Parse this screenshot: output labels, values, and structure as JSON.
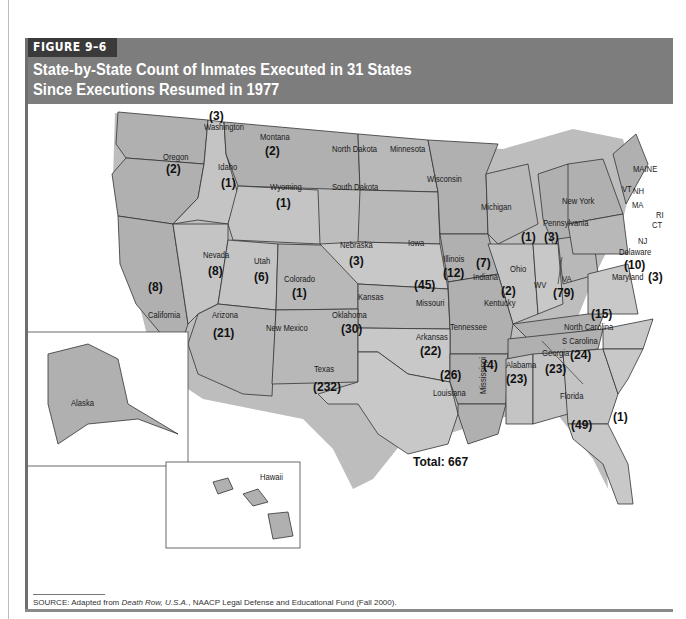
{
  "figure": {
    "label": "FIGURE 9–6",
    "title_line1": "State-by-State Count of Inmates Executed in 31 States",
    "title_line2": "Since Executions Resumed in 1977"
  },
  "colors": {
    "header_bg": "#7d7d7d",
    "label_bg": "#3a3a3a",
    "state_fill_dark": "#a9a9a9",
    "state_fill_light": "#c8c8c8",
    "shadow": "#bdbdbd"
  },
  "map": {
    "total_label": "Total: 667",
    "states": [
      {
        "name": "Washington",
        "count": "(3)"
      },
      {
        "name": "Oregon",
        "count": "(2)"
      },
      {
        "name": "Idaho",
        "count": "(1)"
      },
      {
        "name": "Montana",
        "count": "(2)"
      },
      {
        "name": "Wyoming",
        "count": "(1)"
      },
      {
        "name": "North Dakota",
        "count": ""
      },
      {
        "name": "South Dakota",
        "count": ""
      },
      {
        "name": "Minnesota",
        "count": ""
      },
      {
        "name": "Wisconsin",
        "count": ""
      },
      {
        "name": "Michigan",
        "count": ""
      },
      {
        "name": "Nevada",
        "count": "(8)"
      },
      {
        "name": "Utah",
        "count": "(6)"
      },
      {
        "name": "Colorado",
        "count": "(1)"
      },
      {
        "name": "Nebraska",
        "count": "(3)"
      },
      {
        "name": "Iowa",
        "count": ""
      },
      {
        "name": "Illinois",
        "count": "(12)"
      },
      {
        "name": "Indiana",
        "count": "(7)"
      },
      {
        "name": "Ohio",
        "count": "(1)"
      },
      {
        "name": "Pennsylvania",
        "count": "(3)"
      },
      {
        "name": "New York",
        "count": ""
      },
      {
        "name": "California",
        "count": "(8)"
      },
      {
        "name": "Kansas",
        "count": ""
      },
      {
        "name": "Missouri",
        "count": "(45)"
      },
      {
        "name": "Kentucky",
        "count": "(2)"
      },
      {
        "name": "WV",
        "count": ""
      },
      {
        "name": "VA",
        "count": "(79)"
      },
      {
        "name": "Arizona",
        "count": "(21)"
      },
      {
        "name": "New Mexico",
        "count": ""
      },
      {
        "name": "Oklahoma",
        "count": "(30)"
      },
      {
        "name": "Arkansas",
        "count": "(22)"
      },
      {
        "name": "Tennessee",
        "count": "(1)"
      },
      {
        "name": "North Carolina",
        "count": "(15)"
      },
      {
        "name": "S Carolina",
        "count": "(24)"
      },
      {
        "name": "Texas",
        "count": "(232)"
      },
      {
        "name": "Louisiana",
        "count": "(26)"
      },
      {
        "name": "Mississippi",
        "count": "(4)"
      },
      {
        "name": "Alabama",
        "count": "(23)"
      },
      {
        "name": "Georgia",
        "count": "(23)"
      },
      {
        "name": "Florida",
        "count": "(49)"
      },
      {
        "name": "Delaware",
        "count": "(10)"
      },
      {
        "name": "Maryland",
        "count": "(3)"
      },
      {
        "name": "MAINE",
        "count": ""
      },
      {
        "name": "VT",
        "count": ""
      },
      {
        "name": "NH",
        "count": ""
      },
      {
        "name": "MA",
        "count": ""
      },
      {
        "name": "RI",
        "count": ""
      },
      {
        "name": "CT",
        "count": ""
      },
      {
        "name": "NJ",
        "count": ""
      },
      {
        "name": "Alaska",
        "count": ""
      },
      {
        "name": "Hawaii",
        "count": ""
      }
    ]
  },
  "source": {
    "prefix": "SOURCE: Adapted from ",
    "title": "Death Row, U.S.A.",
    "suffix": ", NAACP Legal Defense and Educational Fund (Fall 2000)."
  }
}
